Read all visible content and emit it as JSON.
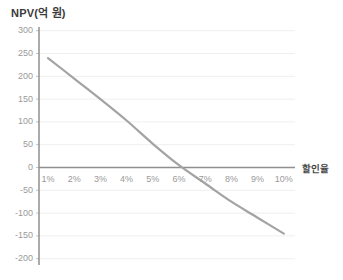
{
  "chart": {
    "title": "NPV(억 원)",
    "x_axis_title": "할인율"
  },
  "chart_data": {
    "type": "line",
    "title": "NPV(억 원)",
    "xlabel": "할인율",
    "ylabel": "NPV(억 원)",
    "x": [
      1,
      2,
      3,
      4,
      5,
      6,
      7,
      8,
      9,
      10
    ],
    "x_tick_labels": [
      "1%",
      "2%",
      "3%",
      "4%",
      "5%",
      "6%",
      "7%",
      "8%",
      "9%",
      "10%"
    ],
    "values": [
      240,
      195,
      150,
      103,
      52,
      5,
      -35,
      -75,
      -110,
      -145
    ],
    "y_ticks": [
      300,
      250,
      200,
      150,
      100,
      50,
      0,
      -50,
      -100,
      -150,
      -200
    ],
    "ylim": [
      -200,
      300
    ],
    "zero_crossing_x_percent": 6.1,
    "grid": true,
    "legend": "none",
    "colors": {
      "line": "#a3a3a3",
      "axis": "#8f8f8f",
      "zero_line": "#8f8f8f",
      "grid": "#efefef",
      "tick_text": "#9a9a9a",
      "title_text": "#3a3a3a",
      "background": "#ffffff"
    }
  }
}
